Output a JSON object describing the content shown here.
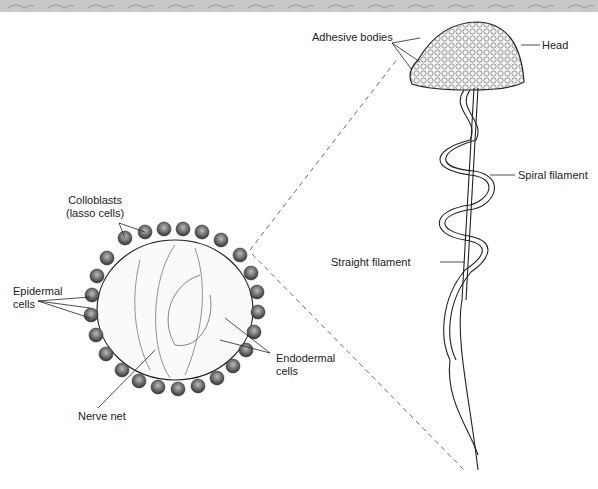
{
  "figure": {
    "labels": {
      "adhesive_bodies": "Adhesive bodies",
      "head": "Head",
      "spiral_filament": "Spiral filament",
      "straight_filament": "Straight filament",
      "colloblasts_line1": "Colloblasts",
      "colloblasts_line2": "(lasso cells)",
      "epidermal_line1": "Epidermal",
      "epidermal_line2": "cells",
      "endodermal_line1": "Endodermal",
      "endodermal_line2": "cells",
      "nerve_net": "Nerve net"
    },
    "colors": {
      "banner": "#c8c8c8",
      "ink": "#222222",
      "background": "#ffffff"
    }
  }
}
